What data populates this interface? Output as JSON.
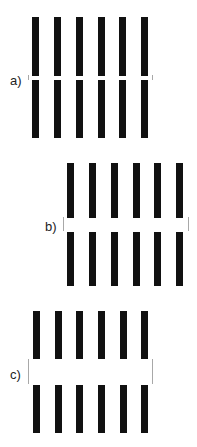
{
  "figure": {
    "panels": [
      {
        "label": "a)",
        "label_pos": [
          10,
          74
        ],
        "bar_xs": [
          32,
          54,
          76,
          98,
          119,
          141
        ],
        "bar_width": 7,
        "top_bars": [
          17,
          76
        ],
        "bottom_bars": [
          80,
          138
        ],
        "ticks": [
          {
            "x": 28,
            "y1": 75,
            "y2": 80
          },
          {
            "x": 152,
            "y1": 75,
            "y2": 80
          }
        ]
      },
      {
        "label": "b)",
        "label_pos": [
          45,
          220
        ],
        "bar_xs": [
          67,
          89,
          111,
          133,
          154,
          176
        ],
        "bar_width": 7,
        "top_bars": [
          163,
          218
        ],
        "bottom_bars": [
          232,
          286
        ],
        "ticks": [
          {
            "x": 63,
            "y1": 217,
            "y2": 231
          },
          {
            "x": 188,
            "y1": 217,
            "y2": 231
          }
        ]
      },
      {
        "label": "c)",
        "label_pos": [
          10,
          368
        ],
        "bar_xs": [
          33,
          55,
          76,
          98,
          120,
          141
        ],
        "bar_width": 7,
        "top_bars": [
          311,
          359
        ],
        "bottom_bars": [
          385,
          433
        ],
        "ticks": [
          {
            "x": 28,
            "y1": 359,
            "y2": 384
          },
          {
            "x": 152,
            "y1": 359,
            "y2": 384
          }
        ]
      }
    ],
    "colors": {
      "bar": "#111111",
      "tick": "#a8a8a8",
      "label": "#222222",
      "background": "#ffffff"
    }
  }
}
